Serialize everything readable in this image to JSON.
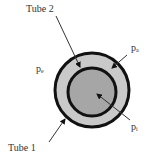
{
  "diagram": {
    "labels": {
      "tube2": "Tube 2",
      "tube1": "Tube 1",
      "p_outer_left": {
        "base": "p",
        "sub": "e"
      },
      "p_outer_right": {
        "base": "p",
        "sub": "a"
      },
      "p_inner": {
        "base": "p",
        "sub": "i"
      }
    },
    "colors": {
      "outer_ring": "#c9c9c9",
      "inner_core": "#a6a6a6",
      "stroke": "#111111",
      "arrow": "#333333"
    }
  }
}
